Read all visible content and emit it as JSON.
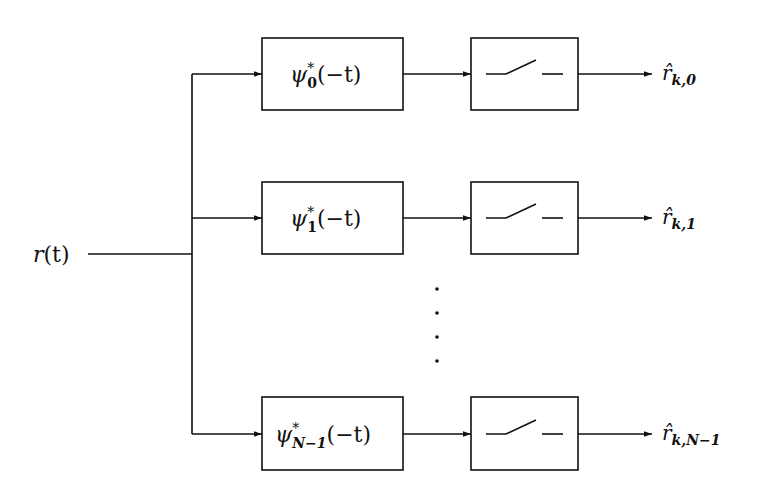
{
  "diagram": {
    "type": "block-diagram",
    "input": {
      "label": "r(t)",
      "symbol": "r",
      "arg": "(t)"
    },
    "branches": [
      {
        "filter": {
          "symbol": "ψ",
          "sup": "*",
          "sub": "0",
          "arg": "(−t)",
          "label": "ψ*_0(−t)"
        },
        "sampler": "sampling-switch",
        "output": {
          "symbol": "r̂",
          "sub": "k,0",
          "label": "r̂_{k,0}"
        }
      },
      {
        "filter": {
          "symbol": "ψ",
          "sup": "*",
          "sub": "1",
          "arg": "(−t)",
          "label": "ψ*_1(−t)"
        },
        "sampler": "sampling-switch",
        "output": {
          "symbol": "r̂",
          "sub": "k,1",
          "label": "r̂_{k,1}"
        }
      },
      {
        "filter": {
          "symbol": "ψ",
          "sup": "*",
          "sub": "N−1",
          "arg": "(−t)",
          "label": "ψ*_{N−1}(−t)"
        },
        "sampler": "sampling-switch",
        "output": {
          "symbol": "r̂",
          "sub": "k,N−1",
          "label": "r̂_{k,N−1}"
        }
      }
    ],
    "ellipsis": "vertical-dots",
    "colors": {
      "stroke": "#111111",
      "background": "#ffffff"
    }
  }
}
